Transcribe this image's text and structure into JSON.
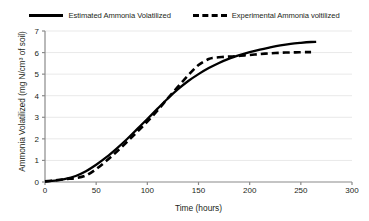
{
  "chart_data": {
    "type": "line",
    "title": "",
    "xlabel": "Time (hours)",
    "ylabel": "Ammonia Volatilized (mg N/cm³ of soil)",
    "xlim": [
      0,
      300
    ],
    "ylim": [
      0,
      7
    ],
    "xticks": [
      0,
      50,
      100,
      150,
      200,
      250,
      300
    ],
    "yticks": [
      0,
      1,
      2,
      3,
      4,
      5,
      6,
      7
    ],
    "grid": "horizontal",
    "legend_position": "top",
    "series": [
      {
        "name": "Estimated Ammonia Volatilized",
        "style": "solid",
        "color": "#000000",
        "x": [
          0,
          10,
          20,
          30,
          40,
          50,
          60,
          70,
          80,
          90,
          100,
          110,
          120,
          130,
          140,
          150,
          160,
          170,
          180,
          190,
          200,
          210,
          220,
          230,
          240,
          250,
          260,
          265
        ],
        "y": [
          0.02,
          0.06,
          0.14,
          0.28,
          0.5,
          0.8,
          1.15,
          1.55,
          1.98,
          2.45,
          2.92,
          3.4,
          3.87,
          4.3,
          4.68,
          5.0,
          5.28,
          5.52,
          5.72,
          5.88,
          6.02,
          6.14,
          6.24,
          6.33,
          6.4,
          6.45,
          6.49,
          6.5
        ]
      },
      {
        "name": "Experimental Ammonia voltilized",
        "style": "dashed",
        "color": "#000000",
        "x": [
          0,
          10,
          20,
          30,
          40,
          50,
          60,
          70,
          80,
          90,
          100,
          110,
          120,
          130,
          140,
          150,
          160,
          165,
          175,
          185,
          195,
          205,
          215,
          225,
          235,
          245,
          255,
          260
        ],
        "y": [
          0.03,
          0.08,
          0.14,
          0.18,
          0.3,
          0.6,
          0.98,
          1.4,
          1.85,
          2.32,
          2.8,
          3.32,
          3.88,
          4.42,
          4.95,
          5.42,
          5.7,
          5.76,
          5.8,
          5.83,
          5.87,
          5.91,
          5.95,
          5.98,
          6.0,
          6.01,
          6.02,
          6.02
        ]
      }
    ]
  },
  "legend": {
    "items": [
      {
        "label": "Estimated Ammonia Volatilized",
        "style": "solid"
      },
      {
        "label": "Experimental Ammonia voltilized",
        "style": "dashed"
      }
    ]
  }
}
